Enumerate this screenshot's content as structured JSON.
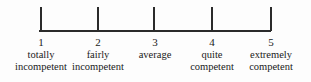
{
  "figure": {
    "type": "rating-scale",
    "background_color": "#fdfdfd",
    "line_color": "#2b2b2b"
  },
  "scale": {
    "axis": {
      "left_px": 39,
      "right_px": 271,
      "baseline_y_px": 31,
      "tick_height_px": 24
    },
    "points": [
      {
        "number": "1",
        "line1": "totally",
        "line2": "incompetent",
        "tick_x_px": 40,
        "center_x_px": 41
      },
      {
        "number": "2",
        "line1": "fairly",
        "line2": "incompetent",
        "tick_x_px": 97,
        "center_x_px": 98
      },
      {
        "number": "3",
        "line1": "average",
        "line2": "",
        "tick_x_px": 153,
        "center_x_px": 155
      },
      {
        "number": "4",
        "line1": "quite",
        "line2": "competent",
        "tick_x_px": 211,
        "center_x_px": 212
      },
      {
        "number": "5",
        "line1": "extremely",
        "line2": "competent",
        "tick_x_px": 270,
        "center_x_px": 270
      }
    ]
  }
}
